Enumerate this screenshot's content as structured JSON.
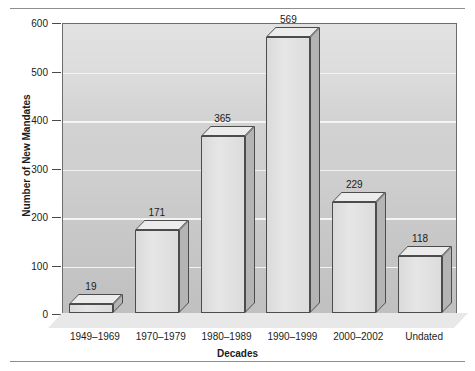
{
  "chart_data": {
    "type": "bar",
    "title": "",
    "xlabel": "Decades",
    "ylabel": "Number of New Mandates",
    "categories": [
      "1949–1969",
      "1970–1979",
      "1980–1989",
      "1990–1999",
      "2000–2002",
      "Undated"
    ],
    "values": [
      19,
      171,
      365,
      569,
      229,
      118
    ],
    "value_labels": [
      "19",
      "171",
      "365",
      "569",
      "229",
      "118"
    ],
    "ylim": [
      0,
      600
    ],
    "ytick_labels": [
      "0",
      "100",
      "200",
      "300",
      "400",
      "500",
      "600"
    ],
    "ytick_values": [
      0,
      100,
      200,
      300,
      400,
      500,
      600
    ],
    "grid": "horizontal-white-gridlines",
    "legend": "none",
    "style": "3d-bars",
    "colors": {
      "bar_front": "#e0e0e0",
      "bar_top": "#ececec",
      "bar_side": "#b4b4b4",
      "bar_outline": "#4c4c4c",
      "plot_background_top": "#e2e2e2",
      "plot_background_bottom": "#c0c0c0",
      "gridline": "#f4f4f4",
      "text": "#1b1b1b",
      "rule": "#8e8e8e"
    }
  }
}
